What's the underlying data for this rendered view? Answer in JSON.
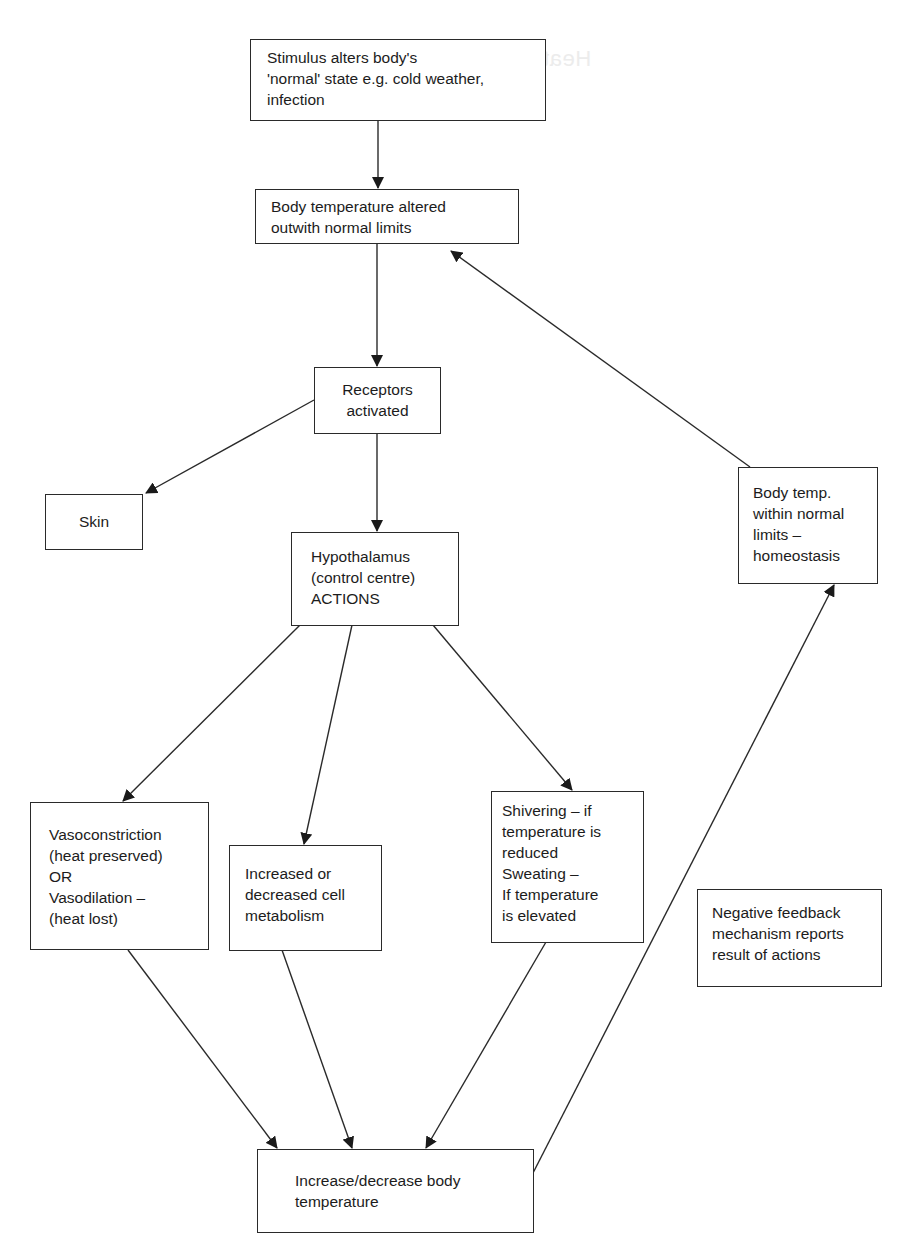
{
  "diagram": {
    "type": "flowchart",
    "topic": "Thermoregulation negative feedback loop",
    "ghost_text": "Heat loss",
    "nodes": {
      "stimulus": "Stimulus alters body's\n'normal' state e.g. cold weather,\ninfection",
      "altered": "Body temperature altered\noutwith normal limits",
      "receptors": "Receptors\nactivated",
      "skin": "Skin",
      "hypothalamus": "Hypothalamus\n(control centre)\nACTIONS",
      "homeostasis": "Body temp.\nwithin normal\nlimits –\nhomeostasis",
      "vaso": "Vasoconstriction\n(heat preserved)\nOR\nVasodilation –\n(heat lost)",
      "metabolism": "Increased or\ndecreased cell\nmetabolism",
      "shivering": "Shivering – if\ntemperature is\nreduced\nSweating –\nIf temperature\nis elevated",
      "result": "Increase/decrease body\ntemperature",
      "note": "Negative feedback\nmechanism reports\nresult of actions"
    },
    "edges": [
      {
        "from": "stimulus",
        "to": "altered"
      },
      {
        "from": "altered",
        "to": "receptors"
      },
      {
        "from": "receptors",
        "to": "skin"
      },
      {
        "from": "receptors",
        "to": "hypothalamus"
      },
      {
        "from": "hypothalamus",
        "to": "vaso"
      },
      {
        "from": "hypothalamus",
        "to": "metabolism"
      },
      {
        "from": "hypothalamus",
        "to": "shivering"
      },
      {
        "from": "vaso",
        "to": "result"
      },
      {
        "from": "metabolism",
        "to": "result"
      },
      {
        "from": "shivering",
        "to": "result"
      },
      {
        "from": "result",
        "to": "homeostasis"
      },
      {
        "from": "homeostasis",
        "to": "altered"
      }
    ],
    "colors": {
      "line": "#2a2a2a",
      "text": "#1c1c1c",
      "background": "#ffffff"
    }
  }
}
